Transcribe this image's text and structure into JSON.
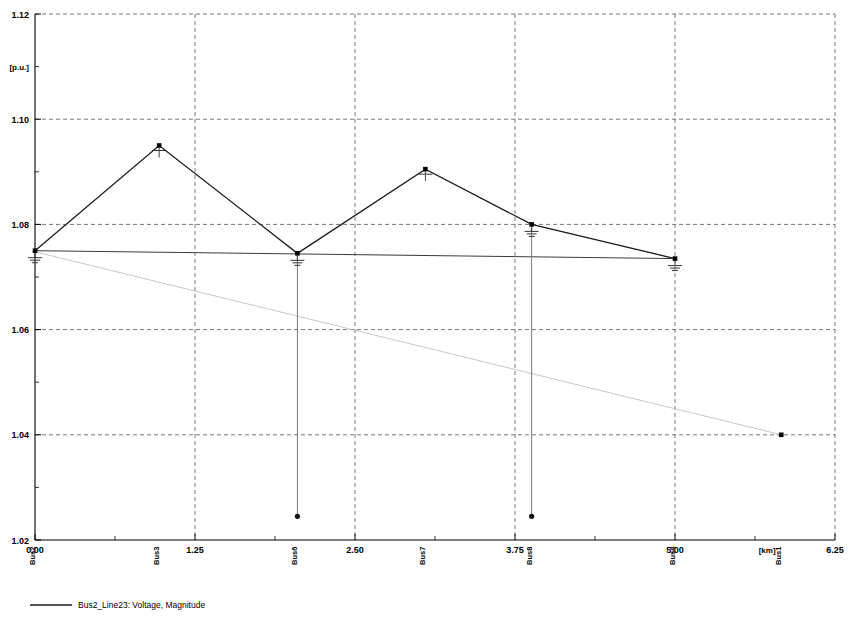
{
  "chart_data": {
    "type": "line",
    "title": "",
    "xlabel": "[km]",
    "ylabel": "[p.u.]",
    "xlim": [
      0.0,
      6.25
    ],
    "ylim": [
      1.02,
      1.12
    ],
    "xticks": [
      "0.00",
      "1.25",
      "2.50",
      "3.75",
      "5.00",
      "6.25"
    ],
    "xtick_values": [
      0.0,
      1.25,
      2.5,
      3.75,
      5.0,
      6.25
    ],
    "yticks": [
      "1.12",
      "1.10",
      "1.08",
      "1.06",
      "1.04",
      "1.02"
    ],
    "ytick_values": [
      1.12,
      1.1,
      1.08,
      1.06,
      1.04,
      1.02
    ],
    "grid": "dashed both axes",
    "legend_position": "below-left",
    "legend": [
      {
        "label": "Bus2_Line23: Voltage, Magnitude",
        "style": "solid",
        "color": "#1a1a1a"
      }
    ],
    "bus_labels": [
      "Bus2",
      "Bus3",
      "Bus6",
      "Bus7",
      "Bus8",
      "Bus4",
      "Bus1"
    ],
    "bus_positions_km": [
      0.0,
      0.97,
      2.05,
      3.05,
      3.88,
      5.0,
      5.83
    ],
    "series": [
      {
        "name": "Bus2_Line23: Voltage, Magnitude",
        "style": "solid",
        "color": "#1a1a1a",
        "x": [
          0.0,
          0.97,
          2.05,
          3.05,
          3.88,
          5.0
        ],
        "values": [
          1.075,
          1.095,
          1.0745,
          1.0905,
          1.08,
          1.0735
        ]
      },
      {
        "name": "horizontal-reference",
        "style": "solid-thin",
        "color": "#3a3a3a",
        "x": [
          0.0,
          5.0
        ],
        "values": [
          1.075,
          1.0735
        ]
      },
      {
        "name": "descending-faint",
        "style": "thin-light",
        "color": "#b8b8b8",
        "x": [
          0.0,
          5.83
        ],
        "values": [
          1.0748,
          1.04
        ]
      }
    ],
    "droppers": [
      {
        "bus": "Bus6",
        "x": 2.05,
        "top": 1.0745,
        "bottom": 1.0245
      },
      {
        "bus": "Bus8",
        "x": 3.88,
        "top": 1.08,
        "bottom": 1.0245
      }
    ],
    "nodes": [
      {
        "bus": "Bus2",
        "x": 0.0,
        "y": 1.075,
        "symbol": "ground"
      },
      {
        "bus": "Bus3",
        "x": 0.97,
        "y": 1.095,
        "symbol": "antenna"
      },
      {
        "bus": "Bus6",
        "x": 2.05,
        "y": 1.0745,
        "symbol": "ground"
      },
      {
        "bus": "Bus7",
        "x": 3.05,
        "y": 1.0905,
        "symbol": "antenna"
      },
      {
        "bus": "Bus8",
        "x": 3.88,
        "y": 1.08,
        "symbol": "ground"
      },
      {
        "bus": "Bus4",
        "x": 5.0,
        "y": 1.0735,
        "symbol": "ground"
      },
      {
        "bus": "Bus1",
        "x": 5.83,
        "y": 1.04,
        "symbol": "dot"
      }
    ],
    "drop_endpoints": [
      {
        "bus": "Bus6",
        "x": 2.05,
        "y": 1.0245
      },
      {
        "bus": "Bus8",
        "x": 3.88,
        "y": 1.0245
      }
    ]
  }
}
